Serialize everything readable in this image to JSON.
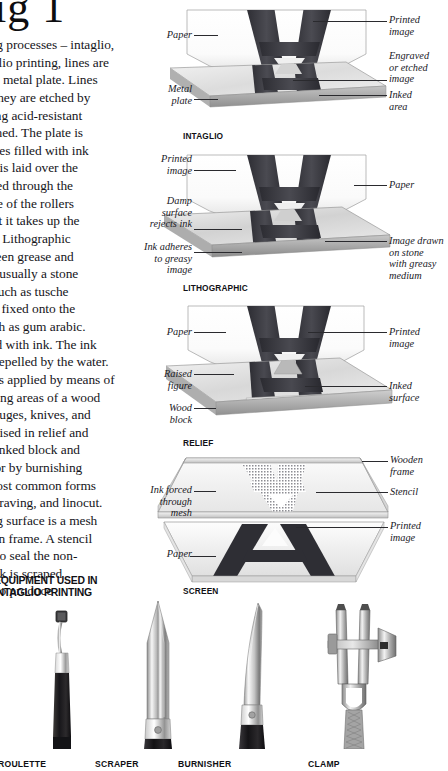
{
  "page": {
    "title": "ig 1",
    "full_title_visible": "ig 1"
  },
  "body_text": {
    "lines": [
      "ing processes – intaglio,",
      "aglio printing, lines are",
      "f a metal plate. Lines",
      " They are etched by",
      "sing acid-resistant",
      "tched. The plate is",
      "oves filled with ink",
      "er is laid over the",
      "ssed through the",
      "ure of the rollers",
      "hat it takes up the",
      "er. Lithographic",
      "ween grease and",
      "—usually a stone",
      ", such as tusche",
      " is fixed onto the",
      "uch as gum arabic.",
      "led with ink. The ink",
      "s repelled by the water.",
      "e is applied by means of",
      "nting areas of a wood",
      "gouges, knives, and",
      " raised in relief and",
      "e inked block and",
      "s or by burnishing",
      "most common forms",
      "ngraving, and linocut.",
      "ing surface is a mesh",
      "den frame. A stencil",
      "h to seal the non-",
      " ink is scraped",
      "n to produce"
    ]
  },
  "equipment_caption": {
    "lines": [
      "EQUIPMENT USED IN",
      "INTAGLIO PRINTING"
    ]
  },
  "diagrams": [
    {
      "id": "intaglio",
      "caption": "INTAGLIO",
      "labels_left": [
        {
          "text": "Paper"
        },
        {
          "text": "Metal\nplate"
        }
      ],
      "labels_right": [
        {
          "text": "Printed\nimage"
        },
        {
          "text": "Engraved\nor etched\nimage"
        },
        {
          "text": "Inked\narea"
        }
      ]
    },
    {
      "id": "lithographic",
      "caption": "LITHOGRAPHIC",
      "labels_left": [
        {
          "text": "Printed\nimage"
        },
        {
          "text": "Damp\nsurface\nrejects ink"
        },
        {
          "text": "Ink adheres\nto greasy\nimage"
        }
      ],
      "labels_right": [
        {
          "text": "Paper"
        },
        {
          "text": "Image drawn\non stone\nwith greasy\nmedium"
        }
      ]
    },
    {
      "id": "relief",
      "caption": "RELIEF",
      "labels_left": [
        {
          "text": "Paper"
        },
        {
          "text": "Raised\nfigure"
        },
        {
          "text": "Wood\nblock"
        }
      ],
      "labels_right": [
        {
          "text": "Printed\nimage"
        },
        {
          "text": "Inked\nsurface"
        }
      ]
    },
    {
      "id": "screen",
      "caption": "SCREEN",
      "labels_left": [
        {
          "text": "Ink forced\nthrough\nmesh"
        },
        {
          "text": "Paper"
        }
      ],
      "labels_right": [
        {
          "text": "Wooden\nframe"
        },
        {
          "text": "Stencil"
        },
        {
          "text": "Printed\nimage"
        }
      ]
    }
  ],
  "tools": [
    {
      "name": "ROULETTE"
    },
    {
      "name": "SCRAPER"
    },
    {
      "name": "BURNISHER"
    },
    {
      "name": "CLAMP"
    }
  ],
  "colors": {
    "ink": "#3a3a40",
    "ink_dark": "#2b2b30",
    "paper": "#ffffff",
    "plate_light": "#e3e3e3",
    "plate_mid": "#c9c9c9",
    "plate_dark": "#9a9a9a",
    "text": "#17171a",
    "leader": "#2a2a2e"
  }
}
